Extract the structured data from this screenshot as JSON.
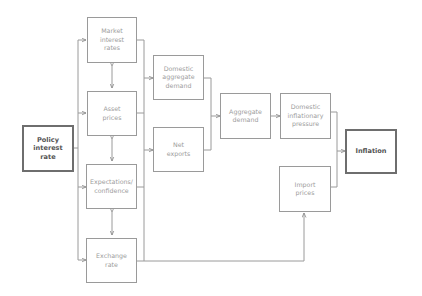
{
  "diagram": {
    "type": "flowchart",
    "direction": "left-to-right",
    "colors": {
      "line": "#9a9a9a",
      "text": "#9c9c9c",
      "emphasis_border": "#6e6e6e",
      "emphasis_text": "#555555"
    },
    "nodes": {
      "policy": {
        "label": "Policy\ninterest\nrate",
        "emphasis": true
      },
      "market_rates": {
        "label": "Market\ninterest\nrates"
      },
      "asset_prices": {
        "label": "Asset\nprices"
      },
      "expectations": {
        "label": "Expectations/\nconfidence"
      },
      "exchange_rate": {
        "label": "Exchange\nrate"
      },
      "domestic_demand": {
        "label": "Domestic\naggregate\ndemand"
      },
      "net_exports": {
        "label": "Net\nexports"
      },
      "aggregate_demand": {
        "label": "Aggregate\ndemand"
      },
      "domestic_inflation": {
        "label": "Domestic\ninflationary\npressure"
      },
      "import_prices": {
        "label": "Import\nprices"
      },
      "inflation": {
        "label": "Inflation",
        "emphasis": true
      }
    },
    "edges": [
      {
        "from": "Policy interest rate",
        "to": "Market interest rates"
      },
      {
        "from": "Policy interest rate",
        "to": "Asset prices"
      },
      {
        "from": "Policy interest rate",
        "to": "Expectations/confidence"
      },
      {
        "from": "Policy interest rate",
        "to": "Exchange rate"
      },
      {
        "from": "Market interest rates",
        "to": "Asset prices",
        "bidirectional": true
      },
      {
        "from": "Asset prices",
        "to": "Expectations/confidence",
        "bidirectional": true
      },
      {
        "from": "Expectations/confidence",
        "to": "Exchange rate",
        "bidirectional": true
      },
      {
        "from": "Market interest rates / Asset prices / Expectations / Exchange rate",
        "to": "Domestic aggregate demand"
      },
      {
        "from": "Market interest rates / Asset prices / Expectations / Exchange rate",
        "to": "Net exports"
      },
      {
        "from": "Domestic aggregate demand",
        "to": "Aggregate demand"
      },
      {
        "from": "Net exports",
        "to": "Aggregate demand"
      },
      {
        "from": "Aggregate demand",
        "to": "Domestic inflationary pressure"
      },
      {
        "from": "Domestic inflationary pressure",
        "to": "Inflation"
      },
      {
        "from": "Import prices",
        "to": "Inflation"
      },
      {
        "from": "Exchange rate",
        "to": "Import prices"
      }
    ]
  }
}
